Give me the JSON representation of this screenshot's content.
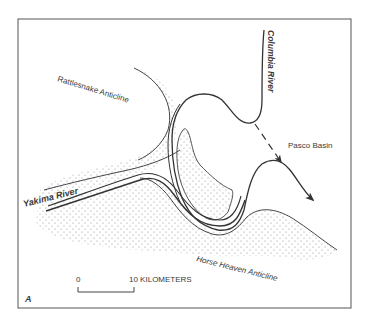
{
  "figure": {
    "panel_letter": "A",
    "frame_color": "#555555",
    "line_color": "#333333",
    "stipple_color": "#8a8a8a"
  },
  "labels": {
    "columbia_river": "Columbia River",
    "rattlesnake_anticline": "Rattlesnake Anticline",
    "pasco_basin": "Pasco Basin",
    "yakima_river": "Yakima River",
    "horse_heaven_anticline": "Horse Heaven Anticline"
  },
  "scale_bar": {
    "start_label": "0",
    "end_label": "10 KILOMETERS"
  },
  "legend": {
    "stippled_area": "anticline ridges",
    "dashed_arrow": "former / alternate river course"
  }
}
